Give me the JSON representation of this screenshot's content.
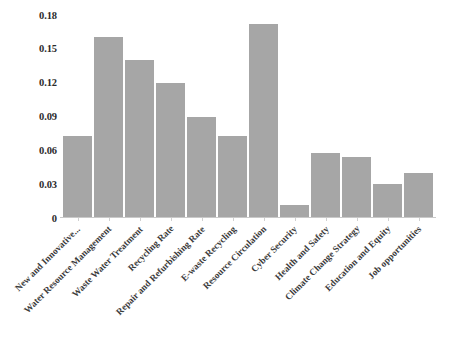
{
  "chart_data": {
    "type": "bar",
    "title": "",
    "subtitle": "",
    "xlabel": "",
    "ylabel": "",
    "ylim": [
      0,
      0.18
    ],
    "grid": false,
    "legend": false,
    "legend_position": "none",
    "bar_color": "#a6a6a6",
    "background_color": "#ffffff",
    "axis_color": "#c9c9c9",
    "text_color": "#2b2b2b",
    "y_ticks": [
      "0",
      "0.03",
      "0.06",
      "0.09",
      "0.12",
      "0.15",
      "0.18"
    ],
    "y_tick_values": [
      0,
      0.03,
      0.06,
      0.09,
      0.12,
      0.15,
      0.18
    ],
    "categories": [
      "New and Innovative...",
      "Water Resource Management",
      "Waste Water Treatment",
      "Recycling Rate",
      "Repair and Refurbishing Rate",
      "E-waste Recycling",
      "Resource Circulation",
      "Cyber Security",
      "Health and Safety",
      "Climate Change Strategy",
      "Education and Equity",
      "Job opportunities"
    ],
    "values": [
      0.072,
      0.16,
      0.139,
      0.119,
      0.089,
      0.072,
      0.171,
      0.011,
      0.057,
      0.053,
      0.029,
      0.039
    ]
  }
}
